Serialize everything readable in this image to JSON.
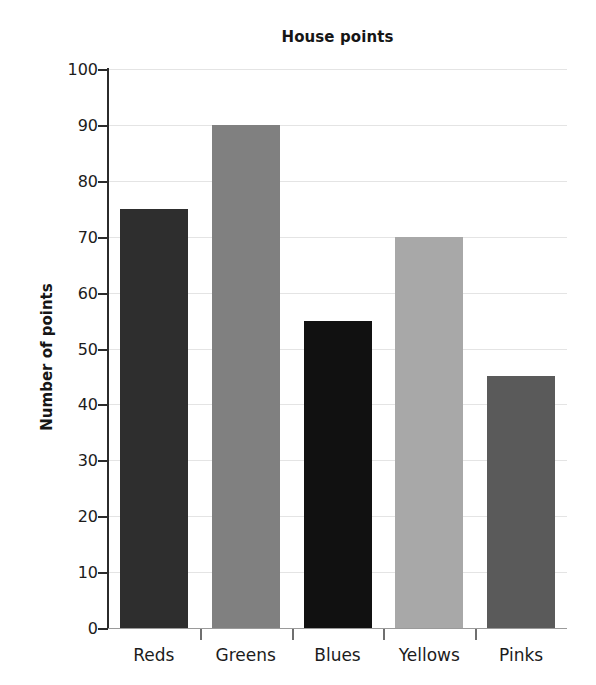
{
  "chart_data": {
    "type": "bar",
    "title": "House points",
    "xlabel": "",
    "ylabel": "Number of points",
    "categories": [
      "Reds",
      "Greens",
      "Blues",
      "Yellows",
      "Pinks"
    ],
    "values": [
      75,
      90,
      55,
      70,
      45
    ],
    "ylim": [
      0,
      100
    ],
    "ytick_step": 10,
    "yticks": [
      0,
      10,
      20,
      30,
      40,
      50,
      60,
      70,
      80,
      90,
      100
    ],
    "ytick_labels": [
      "0",
      "10",
      "20",
      "30",
      "40",
      "50",
      "60",
      "70",
      "80",
      "90",
      "100"
    ],
    "grid": true,
    "grid_axis": "y",
    "legend": false,
    "bar_colors": [
      "#2e2e2e",
      "#808080",
      "#111111",
      "#a8a8a8",
      "#5a5a5a"
    ],
    "gridline_color": "#e4e4e4",
    "axis_color": "#2b2b2b",
    "background_color": "#ffffff"
  }
}
